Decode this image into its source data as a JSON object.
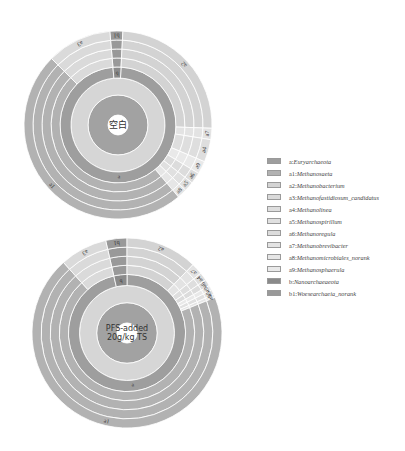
{
  "chart_data": {
    "type": "sunburst",
    "title": "",
    "legend_position": "right",
    "rings": [
      "center-dark",
      "center-light",
      "phylum",
      "genus x4"
    ],
    "charts": [
      {
        "name": "top",
        "center_label": [
          "空白"
        ],
        "center": [
          118,
          125
        ],
        "radius": 94,
        "phylum": [
          {
            "key": "a",
            "label": "a",
            "start": 3,
            "end": 355
          },
          {
            "key": "b",
            "label": "b",
            "start": 355,
            "end": 363
          }
        ],
        "genus": [
          {
            "key": "b1",
            "label": "b1",
            "start": 355,
            "end": 363
          },
          {
            "key": "a2",
            "label": "a2",
            "start": 3,
            "end": 92
          },
          {
            "key": "a7",
            "label": "a7",
            "start": 92,
            "end": 99
          },
          {
            "key": "a4",
            "label": "a4",
            "start": 99,
            "end": 113
          },
          {
            "key": "a9",
            "label": "a9",
            "start": 113,
            "end": 121
          },
          {
            "key": "a6",
            "label": "a6",
            "start": 121,
            "end": 128
          },
          {
            "key": "a5",
            "label": "a5",
            "start": 128,
            "end": 134
          },
          {
            "key": "a8",
            "label": "a8",
            "start": 134,
            "end": 140
          },
          {
            "key": "a1",
            "label": "a1",
            "start": 140,
            "end": 315
          },
          {
            "key": "a3",
            "label": "a3",
            "start": 315,
            "end": 355
          }
        ]
      },
      {
        "name": "bottom",
        "center_label": [
          "PFS-added",
          "20g/kg TS"
        ],
        "center": [
          127,
          333
        ],
        "radius": 95,
        "phylum": [
          {
            "key": "a",
            "label": "a",
            "start": 0,
            "end": 347
          },
          {
            "key": "b",
            "label": "b",
            "start": 347,
            "end": 360
          }
        ],
        "genus": [
          {
            "key": "b1",
            "label": "b1",
            "start": 347,
            "end": 360
          },
          {
            "key": "a2",
            "label": "a2",
            "start": 0,
            "end": 44
          },
          {
            "key": "a7",
            "label": "a7",
            "start": 44,
            "end": 51
          },
          {
            "key": "a4",
            "label": "a4",
            "start": 51,
            "end": 56
          },
          {
            "key": "a6",
            "label": "a6",
            "start": 56,
            "end": 60
          },
          {
            "key": "a9",
            "label": "a9",
            "start": 60,
            "end": 63
          },
          {
            "key": "a5",
            "label": "a5",
            "start": 63,
            "end": 66
          },
          {
            "key": "a8",
            "label": "a8",
            "start": 66,
            "end": 68
          },
          {
            "key": "a1",
            "label": "a1",
            "start": 68,
            "end": 318
          },
          {
            "key": "a3",
            "label": "a3",
            "start": 318,
            "end": 347
          }
        ]
      }
    ]
  },
  "colors": {
    "center_dark": "#a2a2a2",
    "center_light": "#d6d6d6",
    "a": "#9e9e9e",
    "b": "#8a8a8a",
    "a1": "#b2b2b2",
    "a2": "#d3d3d3",
    "a3": "#dadada",
    "a4": "#dedede",
    "a5": "#e0e0e0",
    "a6": "#dcdcdc",
    "a7": "#e3e3e3",
    "a8": "#e6e6e6",
    "a9": "#e9e9e9",
    "b1": "#999999",
    "separator": "#ffffff"
  },
  "legend": [
    {
      "key": "a",
      "prefix": "a:",
      "name": "Euryarchaeota",
      "color": "#9e9e9e"
    },
    {
      "key": "a1",
      "prefix": "a1:",
      "name": "Methanosaeta",
      "color": "#b2b2b2"
    },
    {
      "key": "a2",
      "prefix": "a2:",
      "name": "Methanobacterium",
      "color": "#d3d3d3"
    },
    {
      "key": "a3",
      "prefix": "a3:",
      "name": "Methanofastidiosum_candidatus",
      "color": "#dadada"
    },
    {
      "key": "a4",
      "prefix": "a4:",
      "name": "Methanolinea",
      "color": "#dedede"
    },
    {
      "key": "a5",
      "prefix": "a5:",
      "name": "Methanospirillum",
      "color": "#e0e0e0"
    },
    {
      "key": "a6",
      "prefix": "a6:",
      "name": "Methanoregula",
      "color": "#dcdcdc"
    },
    {
      "key": "a7",
      "prefix": "a7:",
      "name": "Methanobrevibacter",
      "color": "#e3e3e3"
    },
    {
      "key": "a8",
      "prefix": "a8:",
      "name": "Methanomicrobiales_norank",
      "color": "#e6e6e6"
    },
    {
      "key": "a9",
      "prefix": "a9:",
      "name": "Methanosphaerula",
      "color": "#e9e9e9"
    },
    {
      "key": "b",
      "prefix": "b:",
      "name": "Nanoarchaeaeota",
      "color": "#8a8a8a"
    },
    {
      "key": "b1",
      "prefix": "b1:",
      "name": "Woesearchaeia_norank",
      "color": "#999999"
    }
  ]
}
